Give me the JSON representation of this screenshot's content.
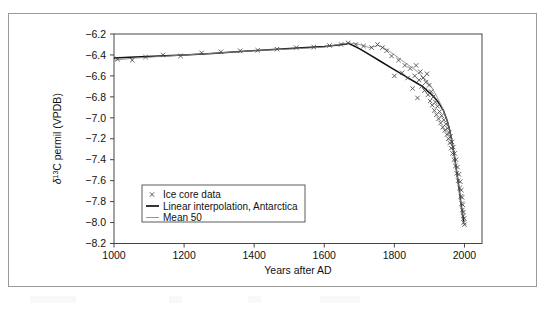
{
  "figure": {
    "alt_name": "ice-core-delta13C-timeseries"
  },
  "chart_data": {
    "type": "line",
    "title": "",
    "xlabel": "Years after AD",
    "ylabel": "δ¹³C permil (VPDB)",
    "xlim": [
      1000,
      2050
    ],
    "ylim": [
      -8.2,
      -6.2
    ],
    "xticks": [
      1000,
      1200,
      1400,
      1600,
      1800,
      2000
    ],
    "xtick_labels": [
      "1000",
      "1200",
      "1400",
      "1600",
      "1800",
      "2000"
    ],
    "yticks": [
      -6.2,
      -6.4,
      -6.6,
      -6.8,
      -7.0,
      -7.2,
      -7.4,
      -7.6,
      -7.8,
      -8.0,
      -8.2
    ],
    "ytick_labels": [
      "−6.2",
      "−6.4",
      "−6.6",
      "−6.8",
      "−7.0",
      "−7.2",
      "−7.4",
      "−7.6",
      "−7.8",
      "−8.0",
      "−8.2"
    ],
    "grid": false,
    "legend_position": "lower-left-inside",
    "legend": [
      {
        "label": "Ice core data",
        "marker": "x",
        "color": "#444444"
      },
      {
        "label": "Linear interpolation, Antarctica",
        "marker": "line",
        "color": "#111111"
      },
      {
        "label": "Mean 50",
        "marker": "line",
        "color": "#8a8a8a"
      }
    ],
    "series": [
      {
        "name": "Linear interpolation, Antarctica",
        "type": "line",
        "color": "#111111",
        "x": [
          1000,
          1060,
          1130,
          1200,
          1280,
          1350,
          1420,
          1490,
          1550,
          1600,
          1640,
          1670,
          1700,
          1730,
          1760,
          1790,
          1820,
          1845,
          1865,
          1880,
          1895,
          1910,
          1925,
          1940,
          1950,
          1958,
          1965,
          1972,
          1978,
          1984,
          1990,
          1995,
          1998
        ],
        "y": [
          -6.43,
          -6.42,
          -6.41,
          -6.4,
          -6.385,
          -6.37,
          -6.355,
          -6.34,
          -6.33,
          -6.32,
          -6.305,
          -6.29,
          -6.34,
          -6.4,
          -6.46,
          -6.52,
          -6.58,
          -6.63,
          -6.67,
          -6.7,
          -6.745,
          -6.79,
          -6.85,
          -6.93,
          -7.02,
          -7.12,
          -7.24,
          -7.38,
          -7.52,
          -7.66,
          -7.82,
          -7.93,
          -7.99
        ]
      },
      {
        "name": "Mean 50",
        "type": "line",
        "color": "#8a8a8a",
        "x": [
          1000,
          1060,
          1130,
          1200,
          1280,
          1350,
          1420,
          1490,
          1550,
          1600,
          1640,
          1670,
          1700,
          1730,
          1755,
          1775,
          1800,
          1825,
          1850,
          1870,
          1890,
          1905,
          1920,
          1935,
          1948,
          1958,
          1968,
          1976,
          1983,
          1990,
          1996
        ],
        "y": [
          -6.45,
          -6.43,
          -6.415,
          -6.4,
          -6.385,
          -6.37,
          -6.355,
          -6.345,
          -6.335,
          -6.325,
          -6.3,
          -6.285,
          -6.3,
          -6.33,
          -6.31,
          -6.34,
          -6.4,
          -6.46,
          -6.52,
          -6.57,
          -6.64,
          -6.7,
          -6.79,
          -6.89,
          -7.0,
          -7.12,
          -7.3,
          -7.47,
          -7.64,
          -7.83,
          -7.95
        ]
      },
      {
        "name": "Ice core data",
        "type": "scatter",
        "marker": "x",
        "color": "#444444",
        "points": [
          [
            1010,
            -6.44
          ],
          [
            1052,
            -6.45
          ],
          [
            1090,
            -6.42
          ],
          [
            1140,
            -6.4
          ],
          [
            1190,
            -6.41
          ],
          [
            1250,
            -6.38
          ],
          [
            1305,
            -6.37
          ],
          [
            1360,
            -6.36
          ],
          [
            1410,
            -6.355
          ],
          [
            1465,
            -6.345
          ],
          [
            1520,
            -6.33
          ],
          [
            1570,
            -6.325
          ],
          [
            1615,
            -6.31
          ],
          [
            1648,
            -6.3
          ],
          [
            1668,
            -6.285
          ],
          [
            1690,
            -6.3
          ],
          [
            1712,
            -6.315
          ],
          [
            1735,
            -6.33
          ],
          [
            1752,
            -6.3
          ],
          [
            1766,
            -6.33
          ],
          [
            1778,
            -6.36
          ],
          [
            1792,
            -6.41
          ],
          [
            1800,
            -6.6
          ],
          [
            1812,
            -6.45
          ],
          [
            1822,
            -6.57
          ],
          [
            1830,
            -6.5
          ],
          [
            1838,
            -6.62
          ],
          [
            1845,
            -6.53
          ],
          [
            1852,
            -6.72
          ],
          [
            1858,
            -6.6
          ],
          [
            1862,
            -6.5
          ],
          [
            1866,
            -6.81
          ],
          [
            1870,
            -6.64
          ],
          [
            1874,
            -6.56
          ],
          [
            1878,
            -6.7
          ],
          [
            1882,
            -6.62
          ],
          [
            1886,
            -6.74
          ],
          [
            1890,
            -6.66
          ],
          [
            1893,
            -6.58
          ],
          [
            1896,
            -6.78
          ],
          [
            1899,
            -6.69
          ],
          [
            1902,
            -6.84
          ],
          [
            1905,
            -6.75
          ],
          [
            1908,
            -6.88
          ],
          [
            1911,
            -6.8
          ],
          [
            1914,
            -6.93
          ],
          [
            1917,
            -6.85
          ],
          [
            1920,
            -6.97
          ],
          [
            1923,
            -6.89
          ],
          [
            1926,
            -7.01
          ],
          [
            1929,
            -6.94
          ],
          [
            1932,
            -7.05
          ],
          [
            1935,
            -6.98
          ],
          [
            1938,
            -7.09
          ],
          [
            1941,
            -7.02
          ],
          [
            1944,
            -7.12
          ],
          [
            1947,
            -7.06
          ],
          [
            1950,
            -7.16
          ],
          [
            1952,
            -7.1
          ],
          [
            1954,
            -7.2
          ],
          [
            1956,
            -7.14
          ],
          [
            1958,
            -7.24
          ],
          [
            1960,
            -7.18
          ],
          [
            1962,
            -7.29
          ],
          [
            1964,
            -7.23
          ],
          [
            1966,
            -7.34
          ],
          [
            1968,
            -7.28
          ],
          [
            1970,
            -7.4
          ],
          [
            1972,
            -7.34
          ],
          [
            1974,
            -7.46
          ],
          [
            1976,
            -7.4
          ],
          [
            1978,
            -7.53
          ],
          [
            1980,
            -7.47
          ],
          [
            1982,
            -7.6
          ],
          [
            1984,
            -7.54
          ],
          [
            1986,
            -7.67
          ],
          [
            1988,
            -7.61
          ],
          [
            1990,
            -7.75
          ],
          [
            1991,
            -7.69
          ],
          [
            1992,
            -7.82
          ],
          [
            1993,
            -7.76
          ],
          [
            1994,
            -7.88
          ],
          [
            1995,
            -7.83
          ],
          [
            1996,
            -7.94
          ],
          [
            1997,
            -7.9
          ],
          [
            1998,
            -8.0
          ],
          [
            1999,
            -7.96
          ],
          [
            2000,
            -8.02
          ]
        ]
      }
    ]
  }
}
